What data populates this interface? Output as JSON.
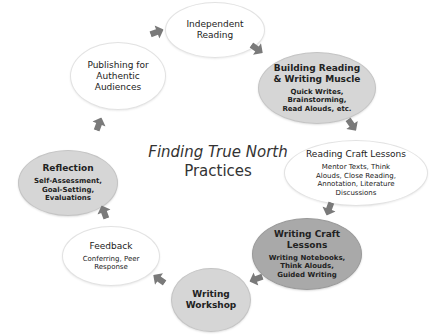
{
  "diagram": {
    "title_line1": "Finding True North",
    "title_line2": "Practices",
    "nodes": [
      {
        "id": "independent-reading",
        "title": "Independent Reading",
        "subtitle": "",
        "shade": "light"
      },
      {
        "id": "building-reading-writing-muscle",
        "title": "Building Reading & Writing Muscle",
        "subtitle": "Quick Writes, Brainstorming, Read Alouds, etc.",
        "shade": "gray"
      },
      {
        "id": "reading-craft-lessons",
        "title": "Reading Craft Lessons",
        "subtitle": "Mentor Texts, Think Alouds, Close Reading, Annotation, Literature Discussions",
        "shade": "light"
      },
      {
        "id": "writing-craft-lessons",
        "title": "Writing Craft Lessons",
        "subtitle": "Writing Notebooks, Think Alouds, Guided Writing",
        "shade": "dark"
      },
      {
        "id": "writing-workshop",
        "title": "Writing Workshop",
        "subtitle": "",
        "shade": "gray"
      },
      {
        "id": "feedback",
        "title": "Feedback",
        "subtitle": "Conferring, Peer Response",
        "shade": "light"
      },
      {
        "id": "reflection",
        "title": "Reflection",
        "subtitle": "Self-Assessment, Goal-Setting, Evaluations",
        "shade": "gray"
      },
      {
        "id": "publishing-for-authentic-audiences",
        "title": "Publishing for Authentic Audiences",
        "subtitle": "",
        "shade": "light"
      }
    ],
    "edges": [
      {
        "from": "independent-reading",
        "to": "building-reading-writing-muscle"
      },
      {
        "from": "building-reading-writing-muscle",
        "to": "reading-craft-lessons"
      },
      {
        "from": "reading-craft-lessons",
        "to": "writing-craft-lessons"
      },
      {
        "from": "writing-craft-lessons",
        "to": "writing-workshop"
      },
      {
        "from": "writing-workshop",
        "to": "feedback"
      },
      {
        "from": "feedback",
        "to": "reflection"
      },
      {
        "from": "reflection",
        "to": "publishing-for-authentic-audiences"
      },
      {
        "from": "publishing-for-authentic-audiences",
        "to": "independent-reading"
      }
    ],
    "colors": {
      "light_node": "#ffffff",
      "gray_node": "#d6d6d6",
      "dark_node": "#a9a9a9",
      "arrow": "#7a7a7a"
    }
  }
}
